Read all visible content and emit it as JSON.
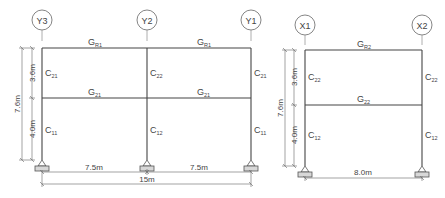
{
  "left_frame": {
    "axes": [
      {
        "label": "Y3",
        "x": 42
      },
      {
        "label": "Y2",
        "x": 147
      },
      {
        "label": "Y1",
        "x": 251
      }
    ],
    "beams": {
      "roof": [
        "G",
        "R1"
      ],
      "floor": [
        "G",
        "21"
      ]
    },
    "columns": {
      "upper_outer": [
        "C",
        "21"
      ],
      "upper_inner": [
        "C",
        "22"
      ],
      "lower_outer": [
        "C",
        "11"
      ],
      "lower_inner": [
        "C",
        "12"
      ]
    },
    "dims": {
      "upper_height": "3.6m",
      "lower_height": "4.0m",
      "total_height": "7.6m",
      "bay1": "7.5m",
      "bay2": "7.5m",
      "total_width": "15m"
    }
  },
  "right_frame": {
    "axes": [
      {
        "label": "X1",
        "x": 305
      },
      {
        "label": "X2",
        "x": 422
      }
    ],
    "beams": {
      "roof": [
        "G",
        "R2"
      ],
      "floor": [
        "G",
        "22"
      ]
    },
    "columns": {
      "upper": [
        "C",
        "22"
      ],
      "lower": [
        "C",
        "12"
      ]
    },
    "dims": {
      "upper_height": "3.6m",
      "lower_height": "4.0m",
      "total_height": "7.6m",
      "span": "8.0m"
    }
  }
}
